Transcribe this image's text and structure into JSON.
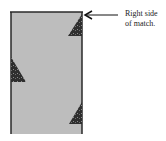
{
  "figure": {
    "label": {
      "line1": "Right side",
      "line2": "of match."
    },
    "match_stick": {
      "fill": "#bdbdbd",
      "edge": "#2a2a2a"
    },
    "triangles": {
      "fill": "#2e2e2e",
      "items": [
        {
          "name": "top-right",
          "side": "right"
        },
        {
          "name": "middle-left",
          "side": "left"
        },
        {
          "name": "bottom-right",
          "side": "right"
        }
      ]
    },
    "arrow": {
      "color": "#111111"
    }
  }
}
